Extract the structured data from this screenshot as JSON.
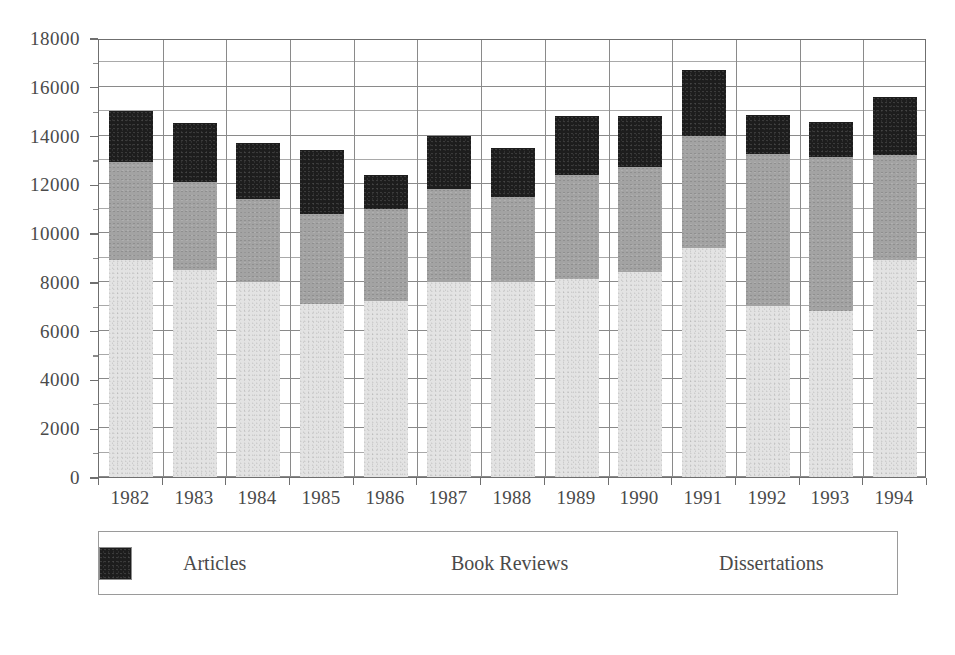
{
  "chart_data": {
    "type": "bar",
    "subtype": "stacked",
    "title": "",
    "xlabel": "",
    "ylabel": "",
    "ylim": [
      0,
      18000
    ],
    "ytick_step": 2000,
    "minor_gridline_step": 1000,
    "grid": true,
    "legend_position": "bottom",
    "categories": [
      "1982",
      "1983",
      "1984",
      "1985",
      "1986",
      "1987",
      "1988",
      "1989",
      "1990",
      "1991",
      "1992",
      "1993",
      "1994"
    ],
    "ytick_labels": [
      "0",
      "2000",
      "4000",
      "6000",
      "8000",
      "10000",
      "12000",
      "14000",
      "16000",
      "18000"
    ],
    "ytick_values": [
      0,
      2000,
      4000,
      6000,
      8000,
      10000,
      12000,
      14000,
      16000,
      18000
    ],
    "series": [
      {
        "name": "Articles",
        "color": "#e3e3e3",
        "values": [
          8900,
          8500,
          8000,
          7100,
          7200,
          8000,
          8000,
          8100,
          8400,
          9400,
          7000,
          6800,
          8900
        ]
      },
      {
        "name": "Book Reviews",
        "color": "#a3a3a3",
        "values": [
          4000,
          3600,
          3400,
          3700,
          3800,
          3800,
          3500,
          4300,
          4300,
          4600,
          6250,
          6320,
          4300
        ]
      },
      {
        "name": "Dissertations",
        "color": "#1d1d1d",
        "values": [
          2100,
          2400,
          2300,
          2600,
          1400,
          2200,
          2000,
          2400,
          2100,
          2700,
          1600,
          1440,
          2380
        ]
      }
    ],
    "totals": [
      15000,
      14500,
      13700,
      13400,
      12400,
      14000,
      13500,
      14800,
      14800,
      16700,
      14850,
      14560,
      15580
    ]
  },
  "legend": {
    "items": [
      {
        "label": "Articles",
        "swatch": "light-gray-swatch"
      },
      {
        "label": "Book Reviews",
        "swatch": "medium-gray-swatch"
      },
      {
        "label": "Dissertations",
        "swatch": "black-swatch"
      }
    ]
  }
}
